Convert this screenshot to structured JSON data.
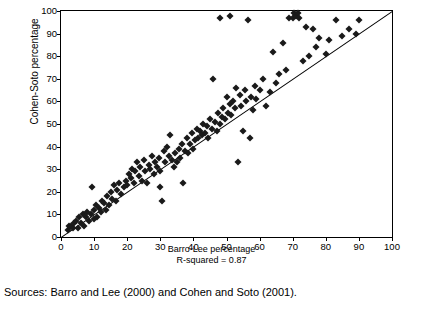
{
  "top_caption": "",
  "sources": "Sources: Barro and Lee (2000) and Cohen and Soto (2001).",
  "chart_data": {
    "type": "scatter",
    "title": "",
    "xlabel": "Barro-Lee percentage",
    "ylabel": "Cohen-Soto percentage",
    "annotation": "R-squared = 0.87",
    "xlim": [
      0,
      100
    ],
    "ylim": [
      0,
      100
    ],
    "xticks": [
      0,
      10,
      20,
      30,
      40,
      50,
      60,
      70,
      80,
      90,
      100
    ],
    "yticks": [
      0,
      10,
      20,
      30,
      40,
      50,
      60,
      70,
      80,
      90,
      100
    ],
    "grid": false,
    "legend": "none",
    "reference_line": {
      "type": "45-degree",
      "from": [
        0,
        0
      ],
      "to": [
        100,
        100
      ]
    },
    "points": [
      [
        2,
        3
      ],
      [
        2.5,
        5
      ],
      [
        3,
        5
      ],
      [
        3.5,
        4
      ],
      [
        4,
        6
      ],
      [
        4.5,
        7
      ],
      [
        5,
        4
      ],
      [
        5.5,
        9
      ],
      [
        6,
        6
      ],
      [
        6.5,
        10
      ],
      [
        7,
        5
      ],
      [
        7.5,
        9
      ],
      [
        8,
        11
      ],
      [
        8.5,
        7
      ],
      [
        9,
        10
      ],
      [
        9.5,
        22
      ],
      [
        10,
        8
      ],
      [
        10,
        12
      ],
      [
        10.5,
        14
      ],
      [
        11,
        9
      ],
      [
        11.5,
        13
      ],
      [
        12,
        11
      ],
      [
        12.5,
        16
      ],
      [
        13,
        15
      ],
      [
        13.5,
        12
      ],
      [
        14,
        18
      ],
      [
        14.5,
        14
      ],
      [
        15,
        20
      ],
      [
        15.5,
        17
      ],
      [
        16,
        23
      ],
      [
        16.5,
        16
      ],
      [
        17,
        21
      ],
      [
        17.5,
        24
      ],
      [
        18,
        19
      ],
      [
        19,
        22
      ],
      [
        19.5,
        25
      ],
      [
        20,
        23
      ],
      [
        20.5,
        28
      ],
      [
        21,
        26
      ],
      [
        21.5,
        30
      ],
      [
        22,
        24
      ],
      [
        22.5,
        29
      ],
      [
        23,
        33
      ],
      [
        23.5,
        27
      ],
      [
        24,
        31
      ],
      [
        24.5,
        25
      ],
      [
        25,
        34
      ],
      [
        25.5,
        29
      ],
      [
        26,
        24
      ],
      [
        26.5,
        32
      ],
      [
        27,
        30
      ],
      [
        27.5,
        36
      ],
      [
        28,
        28
      ],
      [
        28.5,
        33
      ],
      [
        29,
        31
      ],
      [
        29.5,
        35
      ],
      [
        30,
        22
      ],
      [
        30,
        29
      ],
      [
        30.5,
        16
      ],
      [
        31,
        38
      ],
      [
        31.5,
        33
      ],
      [
        32,
        40
      ],
      [
        32.5,
        36
      ],
      [
        33,
        45
      ],
      [
        33.5,
        34
      ],
      [
        34,
        31
      ],
      [
        34.5,
        37
      ],
      [
        35,
        33
      ],
      [
        35.5,
        39
      ],
      [
        36,
        35
      ],
      [
        36.5,
        41
      ],
      [
        37,
        24
      ],
      [
        37.5,
        38
      ],
      [
        38,
        44
      ],
      [
        38.5,
        37
      ],
      [
        39,
        41
      ],
      [
        39.5,
        46
      ],
      [
        40,
        39
      ],
      [
        40.5,
        43
      ],
      [
        41,
        48
      ],
      [
        41.5,
        44
      ],
      [
        42,
        47
      ],
      [
        42.5,
        45
      ],
      [
        43,
        50
      ],
      [
        43.5,
        46
      ],
      [
        44,
        49
      ],
      [
        44.5,
        44
      ],
      [
        45,
        52
      ],
      [
        45.5,
        48
      ],
      [
        46,
        70
      ],
      [
        46.5,
        51
      ],
      [
        47,
        47
      ],
      [
        47.5,
        55
      ],
      [
        48,
        97
      ],
      [
        48,
        50
      ],
      [
        48.5,
        53
      ],
      [
        49,
        57
      ],
      [
        49.5,
        52
      ],
      [
        50,
        62
      ],
      [
        50.5,
        55
      ],
      [
        51,
        98
      ],
      [
        51,
        59
      ],
      [
        51.5,
        54
      ],
      [
        52,
        60
      ],
      [
        52.5,
        57
      ],
      [
        53,
        66
      ],
      [
        53.5,
        33
      ],
      [
        54,
        63
      ],
      [
        54.5,
        58
      ],
      [
        55,
        47
      ],
      [
        55.5,
        65
      ],
      [
        56,
        60
      ],
      [
        56.5,
        96
      ],
      [
        57,
        44
      ],
      [
        57.5,
        62
      ],
      [
        58,
        56
      ],
      [
        58.5,
        67
      ],
      [
        59,
        61
      ],
      [
        60,
        65
      ],
      [
        61,
        70
      ],
      [
        62,
        58
      ],
      [
        63,
        64
      ],
      [
        64,
        82
      ],
      [
        65,
        68
      ],
      [
        66,
        72
      ],
      [
        67,
        86
      ],
      [
        68,
        74
      ],
      [
        69,
        97
      ],
      [
        70,
        97
      ],
      [
        70.5,
        99
      ],
      [
        71,
        98
      ],
      [
        71.5,
        99
      ],
      [
        72,
        97
      ],
      [
        73,
        78
      ],
      [
        74,
        93
      ],
      [
        75,
        80
      ],
      [
        76,
        92
      ],
      [
        77,
        84
      ],
      [
        78,
        88
      ],
      [
        80,
        81
      ],
      [
        81,
        87
      ],
      [
        83,
        96
      ],
      [
        85,
        89
      ],
      [
        87,
        92
      ],
      [
        89,
        90
      ],
      [
        90,
        96
      ]
    ]
  }
}
